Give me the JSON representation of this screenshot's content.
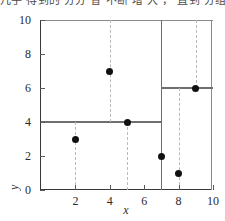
{
  "header": {
    "clipped_text": "几乎 得到的  分分 省 不断 增 大 ， 直到 分组"
  },
  "chart_data": {
    "type": "scatter",
    "title": "",
    "xlabel": "x",
    "ylabel": "y",
    "xlim": [
      0,
      10
    ],
    "ylim": [
      0,
      10
    ],
    "xticks": [
      2,
      4,
      6,
      8,
      10
    ],
    "yticks": [
      0,
      2,
      4,
      6,
      8,
      10
    ],
    "grid": false,
    "legend": null,
    "points": [
      {
        "x": 2,
        "y": 3
      },
      {
        "x": 4,
        "y": 7
      },
      {
        "x": 5,
        "y": 4
      },
      {
        "x": 7,
        "y": 2
      },
      {
        "x": 8,
        "y": 1
      },
      {
        "x": 9,
        "y": 6
      }
    ],
    "split_lines": [
      {
        "orientation": "vertical",
        "at": 7,
        "from": 0,
        "to": 10
      },
      {
        "orientation": "horizontal",
        "at": 4,
        "from": 0,
        "to": 7
      },
      {
        "orientation": "horizontal",
        "at": 6,
        "from": 7,
        "to": 10
      }
    ],
    "drop_lines": [
      {
        "x": 2,
        "from": 0,
        "to": 4
      },
      {
        "x": 4,
        "from": 4,
        "to": 10
      },
      {
        "x": 5,
        "from": 0,
        "to": 4
      },
      {
        "x": 8,
        "from": 0,
        "to": 6
      },
      {
        "x": 9,
        "from": 6,
        "to": 10
      }
    ],
    "colors": {
      "point": "#111111",
      "split_line": "#6e6e6e",
      "drop_line": "#b9b9b9",
      "axis": "#3a3a3a"
    }
  }
}
